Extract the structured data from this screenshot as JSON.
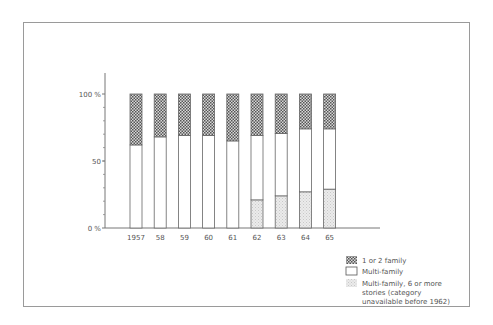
{
  "chart_data": {
    "type": "bar",
    "stacked": true,
    "title": "",
    "xlabel": "",
    "ylabel": "",
    "ylim": [
      0,
      100
    ],
    "y_ticks": [
      {
        "value": 0,
        "label": "0 %"
      },
      {
        "value": 50,
        "label": "50"
      },
      {
        "value": 100,
        "label": "100 %"
      }
    ],
    "y_minor_tick_step": 10,
    "grid": false,
    "categories": [
      "1957",
      "58",
      "59",
      "60",
      "61",
      "62",
      "63",
      "64",
      "65"
    ],
    "series": [
      {
        "name": "Multi-family, 6 or more stories (category unavailable before 1962)",
        "pattern": "light-stipple",
        "values": [
          0,
          0,
          0,
          0,
          0,
          21,
          24,
          27,
          29
        ]
      },
      {
        "name": "Multi-family",
        "pattern": "white",
        "values": [
          62,
          68,
          69,
          69,
          65,
          48,
          46.5,
          47,
          45
        ]
      },
      {
        "name": "1 or 2 family",
        "pattern": "dark-checker",
        "values": [
          38,
          32,
          31,
          31,
          35,
          31,
          29.5,
          26,
          26
        ]
      }
    ],
    "legend": {
      "position": "bottom-right",
      "entries": [
        {
          "label": "1 or 2 family",
          "pattern": "dark-checker"
        },
        {
          "label": "Multi-family",
          "pattern": "white"
        },
        {
          "label_lines": [
            "Multi-family, 6 or more",
            "stories (category",
            "unavailable before 1962)"
          ],
          "pattern": "light-stipple"
        }
      ]
    }
  }
}
